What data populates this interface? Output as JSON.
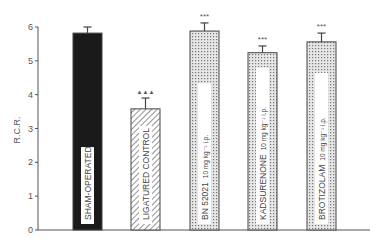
{
  "chart_data": {
    "type": "bar",
    "title": "",
    "xlabel": "",
    "ylabel": "R.C.R.",
    "ylim": [
      0,
      6
    ],
    "yticks": [
      0,
      1,
      2,
      3,
      4,
      5,
      6
    ],
    "grid": false,
    "legend": null,
    "categories": [
      "SHAM-OPERATED",
      "LIGATURED CONTROL",
      "BN 52021 10 mg kg⁻¹ i.p.",
      "KADSURENONE 10 mg kg⁻¹ i.p.",
      "BROTIZOLAM 10 mg kg⁻¹ i.p."
    ],
    "values": [
      5.82,
      3.58,
      5.88,
      5.24,
      5.56
    ],
    "errors": [
      0.18,
      0.32,
      0.24,
      0.2,
      0.26
    ],
    "fills": [
      "solid-black",
      "diagonal-hatch",
      "dotted",
      "dotted",
      "dotted"
    ],
    "annotations": [
      "",
      "▲▲▲",
      "***",
      "***",
      "***"
    ]
  },
  "labels": {
    "bars": [
      {
        "main": "SHAM-OPERATED",
        "sub": ""
      },
      {
        "main": "LIGATURED CONTROL",
        "sub": ""
      },
      {
        "main": "BN 52021",
        "sub": "10 mg kg⁻¹ i.p."
      },
      {
        "main": "KADSURENONE",
        "sub": "10 mg kg⁻¹ i.p."
      },
      {
        "main": "BROTIZOLAM",
        "sub": "10 mg kg⁻¹ i.p."
      }
    ]
  }
}
